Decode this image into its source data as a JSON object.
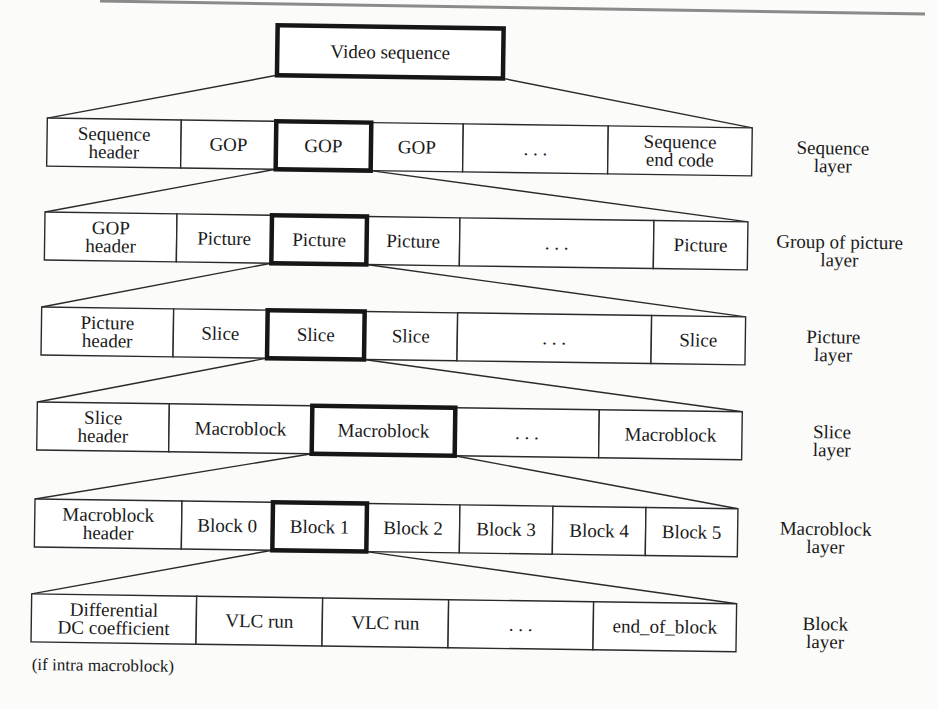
{
  "figure": {
    "root": {
      "label": "Video sequence",
      "x": 273,
      "y": 28,
      "w": 226,
      "h": 50
    },
    "tilt_deg": 0.8,
    "font_size": 19,
    "layers": [
      {
        "name": "sequence-layer",
        "label_lines": [
          "Sequence",
          "layer"
        ],
        "y": 124,
        "h": 48,
        "label_x": 830,
        "highlight_index": 2,
        "cells": [
          {
            "lines": [
              "Sequence",
              "header"
            ],
            "x": 44,
            "w": 134
          },
          {
            "lines": [
              "GOP"
            ],
            "x": 178,
            "w": 95
          },
          {
            "lines": [
              "GOP"
            ],
            "x": 273,
            "w": 95
          },
          {
            "lines": [
              "GOP"
            ],
            "x": 368,
            "w": 92
          },
          {
            "lines": [
              "..."
            ],
            "x": 460,
            "w": 145
          },
          {
            "lines": [
              "Sequence",
              "end code"
            ],
            "x": 605,
            "w": 144
          }
        ]
      },
      {
        "name": "group-of-picture-layer",
        "label_lines": [
          "Group of picture",
          "layer"
        ],
        "y": 218,
        "h": 48,
        "label_x": 838,
        "highlight_index": 2,
        "cells": [
          {
            "lines": [
              "GOP",
              "header"
            ],
            "x": 43,
            "w": 132
          },
          {
            "lines": [
              "Picture"
            ],
            "x": 175,
            "w": 95
          },
          {
            "lines": [
              "Picture"
            ],
            "x": 270,
            "w": 95
          },
          {
            "lines": [
              "Picture"
            ],
            "x": 365,
            "w": 93
          },
          {
            "lines": [
              "..."
            ],
            "x": 458,
            "w": 194
          },
          {
            "lines": [
              "Picture"
            ],
            "x": 652,
            "w": 94
          }
        ]
      },
      {
        "name": "picture-layer",
        "label_lines": [
          "Picture",
          "layer"
        ],
        "y": 313,
        "h": 48,
        "label_x": 833,
        "highlight_index": 2,
        "cells": [
          {
            "lines": [
              "Picture",
              "header"
            ],
            "x": 41,
            "w": 132
          },
          {
            "lines": [
              "Slice"
            ],
            "x": 173,
            "w": 94
          },
          {
            "lines": [
              "Slice"
            ],
            "x": 267,
            "w": 97
          },
          {
            "lines": [
              "Slice"
            ],
            "x": 364,
            "w": 93
          },
          {
            "lines": [
              "..."
            ],
            "x": 457,
            "w": 194
          },
          {
            "lines": [
              "Slice"
            ],
            "x": 651,
            "w": 94
          }
        ]
      },
      {
        "name": "slice-layer",
        "label_lines": [
          "Slice",
          "layer"
        ],
        "y": 408,
        "h": 48,
        "label_x": 833,
        "highlight_index": 2,
        "cells": [
          {
            "lines": [
              "Slice",
              "header"
            ],
            "x": 38,
            "w": 132
          },
          {
            "lines": [
              "Macroblock"
            ],
            "x": 170,
            "w": 143
          },
          {
            "lines": [
              "Macroblock"
            ],
            "x": 313,
            "w": 143
          },
          {
            "lines": [
              "..."
            ],
            "x": 456,
            "w": 144
          },
          {
            "lines": [
              "Macroblock"
            ],
            "x": 600,
            "w": 143
          }
        ]
      },
      {
        "name": "macroblock-layer",
        "label_lines": [
          "Macroblock",
          "layer"
        ],
        "y": 505,
        "h": 48,
        "label_x": 828,
        "highlight_index": 2,
        "cells": [
          {
            "lines": [
              "Macroblock",
              "header"
            ],
            "x": 37,
            "w": 147
          },
          {
            "lines": [
              "Block 0"
            ],
            "x": 184,
            "w": 91
          },
          {
            "lines": [
              "Block 1"
            ],
            "x": 275,
            "w": 94
          },
          {
            "lines": [
              "Block 2"
            ],
            "x": 369,
            "w": 93
          },
          {
            "lines": [
              "Block 3"
            ],
            "x": 462,
            "w": 93
          },
          {
            "lines": [
              "Block 4"
            ],
            "x": 555,
            "w": 93
          },
          {
            "lines": [
              "Block 5"
            ],
            "x": 648,
            "w": 92
          }
        ]
      },
      {
        "name": "block-layer",
        "label_lines": [
          "Block",
          "layer"
        ],
        "y": 600,
        "h": 48,
        "label_x": 829,
        "highlight_index": -1,
        "cells": [
          {
            "lines": [
              "Differential",
              "DC coefficient"
            ],
            "x": 35,
            "w": 165
          },
          {
            "lines": [
              "VLC run"
            ],
            "x": 200,
            "w": 126
          },
          {
            "lines": [
              "VLC run"
            ],
            "x": 326,
            "w": 126
          },
          {
            "lines": [
              "..."
            ],
            "x": 452,
            "w": 145
          },
          {
            "lines": [
              "end_of_block"
            ],
            "x": 597,
            "w": 143
          }
        ]
      }
    ],
    "footnote": {
      "text": "(if intra macroblock)",
      "x": 36,
      "y": 676
    },
    "top_rule": {
      "x1": 100,
      "y1": 1,
      "x2": 925,
      "y2": 14
    }
  }
}
